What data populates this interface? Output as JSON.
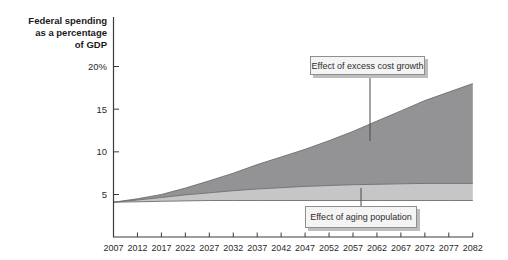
{
  "title": {
    "lines": [
      "Federal spending",
      "as a percentage",
      "of GDP"
    ],
    "full": "Federal spending as a percentage of GDP"
  },
  "callouts": {
    "excess_label": "Effect of excess cost growth",
    "aging_label": "Effect of aging population"
  },
  "chart_data": {
    "type": "area",
    "title": "Federal spending as a percentage of GDP",
    "xlabel": "",
    "ylabel": "Federal spending as a percentage of GDP",
    "x": [
      2007,
      2012,
      2017,
      2022,
      2027,
      2032,
      2037,
      2042,
      2047,
      2052,
      2057,
      2062,
      2067,
      2072,
      2077,
      2082
    ],
    "series": [
      {
        "name": "baseline-spending-lower-bound",
        "values": [
          4.1,
          4.15,
          4.2,
          4.25,
          4.3,
          4.3,
          4.3,
          4.3,
          4.3,
          4.3,
          4.3,
          4.3,
          4.3,
          4.3,
          4.3,
          4.3
        ]
      },
      {
        "name": "spending-with-aging-population",
        "values": [
          4.1,
          4.35,
          4.65,
          4.95,
          5.2,
          5.45,
          5.65,
          5.8,
          5.95,
          6.05,
          6.15,
          6.2,
          6.25,
          6.3,
          6.3,
          6.3
        ]
      },
      {
        "name": "spending-with-excess-cost-growth-total",
        "values": [
          4.1,
          4.5,
          5.0,
          5.75,
          6.6,
          7.5,
          8.5,
          9.4,
          10.3,
          11.3,
          12.4,
          13.6,
          14.8,
          16.0,
          17.0,
          18.0
        ]
      }
    ],
    "bands": [
      {
        "label": "Effect of aging population",
        "between": [
          "baseline-spending-lower-bound",
          "spending-with-aging-population"
        ]
      },
      {
        "label": "Effect of excess cost growth",
        "between": [
          "spending-with-aging-population",
          "spending-with-excess-cost-growth-total"
        ]
      }
    ],
    "ytick_values": [
      20,
      15,
      10,
      5
    ],
    "ytick_labels": [
      "20%",
      "15",
      "10",
      "5"
    ],
    "ylim": [
      0,
      21
    ],
    "grid": false,
    "legend": "none (labeled by callout boxes)",
    "colors": {
      "excess_area": "#939396",
      "aging_area": "#c6c6c8",
      "boundary_line": "#6e6e70",
      "axis": "#3b3b3b",
      "connector": "#4a4a4a",
      "callout_bg": "#f4f4f4",
      "callout_border": "#8f8f8f",
      "callout_shadow": "#bdbdbd"
    }
  }
}
